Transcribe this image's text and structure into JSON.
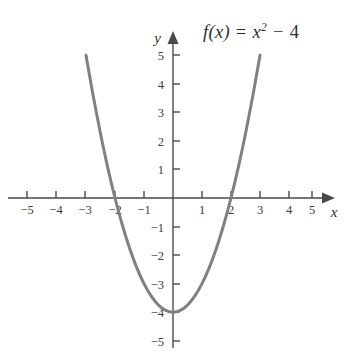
{
  "figure": {
    "background_color": "#ffffff",
    "width": 351,
    "height": 358
  },
  "function_label": {
    "full_text": "f(x) = x² − 4",
    "fn_name": "f",
    "open_paren": "(",
    "variable": "x",
    "close_paren": ")",
    "equals": "=",
    "base": "x",
    "exponent": "2",
    "minus": "−",
    "constant": "4"
  },
  "axes": {
    "x_axis_name": "x",
    "y_axis_name": "y",
    "x_tick_labels": [
      "−5",
      "−4",
      "−3",
      "−2",
      "−1",
      "1",
      "2",
      "3",
      "4",
      "5"
    ],
    "y_tick_labels": [
      "5",
      "4",
      "3",
      "2",
      "1",
      "−1",
      "−2",
      "−3",
      "−4",
      "−5"
    ],
    "axis_color": "#4a4a4a"
  },
  "chart_data": {
    "type": "line",
    "title": "",
    "subtitle": "",
    "xlabel": "x",
    "ylabel": "y",
    "annotations": [
      "f(x) = x² − 4"
    ],
    "legend_position": "none",
    "grid": false,
    "xlim": [
      -5.7,
      5.25
    ],
    "ylim": [
      -5.25,
      5.8
    ],
    "xticks": [
      -5,
      -4,
      -3,
      -2,
      -1,
      1,
      2,
      3,
      4,
      5
    ],
    "yticks": [
      5,
      4,
      3,
      2,
      1,
      -1,
      -2,
      -3,
      -4,
      -5
    ],
    "xtick_labels": [
      "−5",
      "−4",
      "−3",
      "−2",
      "−1",
      "1",
      "2",
      "3",
      "4",
      "5"
    ],
    "ytick_labels": [
      "5",
      "4",
      "3",
      "2",
      "1",
      "−1",
      "−2",
      "−3",
      "−4",
      "−5"
    ],
    "series": [
      {
        "name": "f(x) = x² − 4",
        "equation": "y = x^2 - 4",
        "color": "#808080",
        "linewidth": 3,
        "domain": [
          -3,
          3
        ],
        "vertex": [
          0,
          -4
        ],
        "roots": [
          -2,
          2
        ],
        "y_intercept": -4,
        "x": [
          -3,
          -2.75,
          -2.5,
          -2.25,
          -2,
          -1.75,
          -1.5,
          -1.25,
          -1,
          -0.75,
          -0.5,
          -0.25,
          0,
          0.25,
          0.5,
          0.75,
          1,
          1.25,
          1.5,
          1.75,
          2,
          2.25,
          2.5,
          2.75,
          3
        ],
        "values": [
          5,
          3.5625,
          2.25,
          1.0625,
          0,
          -0.9375,
          -1.75,
          -2.4375,
          -3,
          -3.4375,
          -3.75,
          -3.9375,
          -4,
          -3.9375,
          -3.75,
          -3.4375,
          -3,
          -2.4375,
          -1.75,
          -0.9375,
          0,
          1.0625,
          2.25,
          3.5625,
          5
        ]
      }
    ]
  }
}
